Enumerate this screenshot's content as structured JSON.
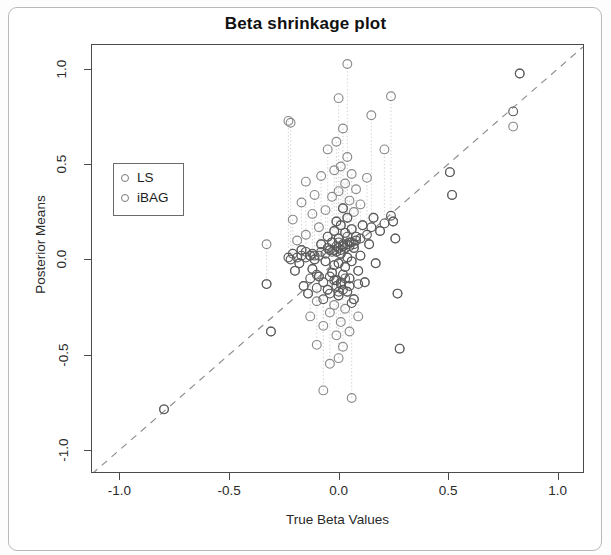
{
  "page": {
    "background": "#ffffff",
    "frame_color": "#b9b9b9"
  },
  "chart_data": {
    "type": "scatter",
    "title": "Beta shrinkage plot",
    "xlabel": "True Beta Values",
    "ylabel": "Posterior Means",
    "xlim": [
      -1.13,
      1.12
    ],
    "ylim": [
      -1.12,
      1.13
    ],
    "xticks": [
      -1.0,
      -0.5,
      0.0,
      0.5,
      1.0
    ],
    "xticklabels": [
      "-1.0",
      "-0.5",
      "0.0",
      "0.5",
      "1.0"
    ],
    "yticks": [
      -1.0,
      -0.5,
      0.0,
      0.5,
      1.0
    ],
    "yticklabels": [
      "-1.0",
      "-0.5",
      "0.0",
      "0.5",
      "1.0"
    ],
    "grid": false,
    "legend_position": "upper-left",
    "legend": [
      {
        "name": "LS",
        "marker": "open-circle",
        "color": "#7a7a7a"
      },
      {
        "name": "iBAG",
        "marker": "open-circle",
        "color": "#5a5a5a"
      }
    ],
    "reference_line": {
      "label": "y = x identity line",
      "style": "dashed",
      "color": "#8d8d8d",
      "slope": 1,
      "intercept": 0,
      "x_from": -1.13,
      "x_to": 1.12
    },
    "connector_lines": {
      "label": "vertical dotted segments joining LS and iBAG estimates",
      "style": "dotted",
      "color": "#d6d6d6"
    },
    "series": [
      {
        "name": "LS",
        "marker": "open-circle",
        "color": "#8a8a8a",
        "points": [
          [
            -0.8,
            -0.79
          ],
          [
            -0.33,
            0.08
          ],
          [
            -0.33,
            -0.13
          ],
          [
            -0.31,
            -0.38
          ],
          [
            -0.23,
            0.73
          ],
          [
            -0.22,
            0.72
          ],
          [
            -0.21,
            0.21
          ],
          [
            -0.2,
            -0.06
          ],
          [
            -0.19,
            0.1
          ],
          [
            -0.18,
            -0.02
          ],
          [
            -0.17,
            0.3
          ],
          [
            -0.17,
            0.05
          ],
          [
            -0.16,
            -0.14
          ],
          [
            -0.15,
            0.41
          ],
          [
            -0.15,
            0.13
          ],
          [
            -0.14,
            -0.18
          ],
          [
            -0.13,
            0.02
          ],
          [
            -0.13,
            -0.3
          ],
          [
            -0.12,
            0.24
          ],
          [
            -0.12,
            -0.05
          ],
          [
            -0.11,
            0.34
          ],
          [
            -0.11,
            0.0
          ],
          [
            -0.1,
            -0.22
          ],
          [
            -0.1,
            -0.45
          ],
          [
            -0.09,
            0.17
          ],
          [
            -0.09,
            -0.09
          ],
          [
            -0.08,
            0.44
          ],
          [
            -0.08,
            0.08
          ],
          [
            -0.07,
            -0.35
          ],
          [
            -0.07,
            -0.69
          ],
          [
            -0.06,
            0.26
          ],
          [
            -0.06,
            -0.01
          ],
          [
            -0.05,
            0.58
          ],
          [
            -0.05,
            0.12
          ],
          [
            -0.05,
            -0.16
          ],
          [
            -0.04,
            0.05
          ],
          [
            -0.04,
            -0.28
          ],
          [
            -0.04,
            -0.55
          ],
          [
            -0.03,
            0.33
          ],
          [
            -0.03,
            0.09
          ],
          [
            -0.03,
            -0.07
          ],
          [
            -0.02,
            0.47
          ],
          [
            -0.02,
            0.15
          ],
          [
            -0.02,
            -0.03
          ],
          [
            -0.02,
            -0.24
          ],
          [
            -0.01,
            0.62
          ],
          [
            -0.01,
            0.2
          ],
          [
            -0.01,
            0.04
          ],
          [
            -0.01,
            -0.11
          ],
          [
            -0.01,
            -0.4
          ],
          [
            0.0,
            0.85
          ],
          [
            0.0,
            0.36
          ],
          [
            0.0,
            0.11
          ],
          [
            0.0,
            -0.02
          ],
          [
            0.0,
            -0.19
          ],
          [
            0.0,
            -0.52
          ],
          [
            0.01,
            0.49
          ],
          [
            0.01,
            0.18
          ],
          [
            0.01,
            0.03
          ],
          [
            0.01,
            -0.13
          ],
          [
            0.01,
            -0.33
          ],
          [
            0.02,
            0.69
          ],
          [
            0.02,
            0.27
          ],
          [
            0.02,
            0.07
          ],
          [
            0.02,
            -0.08
          ],
          [
            0.02,
            -0.46
          ],
          [
            0.03,
            0.4
          ],
          [
            0.03,
            0.14
          ],
          [
            0.03,
            -0.04
          ],
          [
            0.03,
            -0.26
          ],
          [
            0.04,
            1.03
          ],
          [
            0.04,
            0.54
          ],
          [
            0.04,
            0.22
          ],
          [
            0.04,
            0.01
          ],
          [
            0.04,
            -0.17
          ],
          [
            0.05,
            0.31
          ],
          [
            0.05,
            0.09
          ],
          [
            0.05,
            -0.1
          ],
          [
            0.05,
            -0.38
          ],
          [
            0.06,
            0.45
          ],
          [
            0.06,
            0.16
          ],
          [
            0.06,
            -0.01
          ],
          [
            0.06,
            -0.73
          ],
          [
            0.07,
            0.25
          ],
          [
            0.07,
            0.06
          ],
          [
            0.07,
            -0.21
          ],
          [
            0.08,
            0.37
          ],
          [
            0.08,
            0.12
          ],
          [
            0.09,
            -0.06
          ],
          [
            0.09,
            -0.3
          ],
          [
            0.1,
            0.29
          ],
          [
            0.1,
            0.02
          ],
          [
            0.11,
            0.18
          ],
          [
            0.12,
            -0.12
          ],
          [
            0.13,
            0.43
          ],
          [
            0.14,
            0.08
          ],
          [
            0.15,
            0.76
          ],
          [
            0.16,
            0.22
          ],
          [
            0.17,
            -0.02
          ],
          [
            0.19,
            0.15
          ],
          [
            0.21,
            0.58
          ],
          [
            0.24,
            0.86
          ],
          [
            0.25,
            0.2
          ],
          [
            0.26,
            0.11
          ],
          [
            0.27,
            -0.18
          ],
          [
            0.28,
            -0.47
          ],
          [
            0.51,
            0.46
          ],
          [
            0.52,
            0.34
          ],
          [
            0.8,
            0.7
          ],
          [
            0.83,
            0.98
          ]
        ]
      },
      {
        "name": "iBAG",
        "marker": "open-circle",
        "color": "#5a5a5a",
        "points": [
          [
            -0.8,
            -0.79
          ],
          [
            -0.33,
            -0.13
          ],
          [
            -0.31,
            -0.38
          ],
          [
            -0.23,
            0.01
          ],
          [
            -0.22,
            0.0
          ],
          [
            -0.21,
            0.03
          ],
          [
            -0.2,
            -0.06
          ],
          [
            -0.19,
            0.01
          ],
          [
            -0.18,
            -0.02
          ],
          [
            -0.17,
            0.02
          ],
          [
            -0.17,
            0.05
          ],
          [
            -0.16,
            -0.14
          ],
          [
            -0.15,
            0.04
          ],
          [
            -0.15,
            0.01
          ],
          [
            -0.14,
            -0.18
          ],
          [
            -0.13,
            0.02
          ],
          [
            -0.13,
            -0.1
          ],
          [
            -0.12,
            0.03
          ],
          [
            -0.12,
            -0.05
          ],
          [
            -0.11,
            0.02
          ],
          [
            -0.11,
            0.0
          ],
          [
            -0.1,
            -0.08
          ],
          [
            -0.1,
            -0.15
          ],
          [
            -0.09,
            0.02
          ],
          [
            -0.09,
            -0.09
          ],
          [
            -0.08,
            0.04
          ],
          [
            -0.08,
            0.08
          ],
          [
            -0.07,
            -0.12
          ],
          [
            -0.07,
            -0.21
          ],
          [
            -0.06,
            0.03
          ],
          [
            -0.06,
            -0.01
          ],
          [
            -0.05,
            0.06
          ],
          [
            -0.05,
            0.12
          ],
          [
            -0.05,
            -0.16
          ],
          [
            -0.04,
            0.05
          ],
          [
            -0.04,
            -0.09
          ],
          [
            -0.04,
            -0.18
          ],
          [
            -0.03,
            0.04
          ],
          [
            -0.03,
            0.09
          ],
          [
            -0.03,
            -0.07
          ],
          [
            -0.02,
            0.05
          ],
          [
            -0.02,
            0.15
          ],
          [
            -0.02,
            -0.03
          ],
          [
            -0.02,
            -0.11
          ],
          [
            -0.01,
            0.07
          ],
          [
            -0.01,
            0.2
          ],
          [
            -0.01,
            0.04
          ],
          [
            -0.01,
            -0.11
          ],
          [
            -0.01,
            -0.14
          ],
          [
            0.0,
            0.09
          ],
          [
            0.0,
            0.06
          ],
          [
            0.0,
            0.11
          ],
          [
            0.0,
            -0.02
          ],
          [
            0.0,
            -0.19
          ],
          [
            0.0,
            -0.17
          ],
          [
            0.01,
            0.05
          ],
          [
            0.01,
            0.18
          ],
          [
            0.01,
            0.03
          ],
          [
            0.01,
            -0.13
          ],
          [
            0.01,
            -0.12
          ],
          [
            0.02,
            0.08
          ],
          [
            0.02,
            0.27
          ],
          [
            0.02,
            0.07
          ],
          [
            0.02,
            -0.08
          ],
          [
            0.02,
            -0.16
          ],
          [
            0.03,
            0.06
          ],
          [
            0.03,
            0.14
          ],
          [
            0.03,
            -0.04
          ],
          [
            0.03,
            -0.1
          ],
          [
            0.04,
            0.12
          ],
          [
            0.04,
            0.08
          ],
          [
            0.04,
            0.22
          ],
          [
            0.04,
            0.01
          ],
          [
            0.04,
            -0.17
          ],
          [
            0.05,
            0.07
          ],
          [
            0.05,
            0.09
          ],
          [
            0.05,
            -0.1
          ],
          [
            0.05,
            -0.14
          ],
          [
            0.06,
            0.09
          ],
          [
            0.06,
            0.16
          ],
          [
            0.06,
            -0.01
          ],
          [
            0.06,
            -0.23
          ],
          [
            0.07,
            0.08
          ],
          [
            0.07,
            0.06
          ],
          [
            0.07,
            -0.21
          ],
          [
            0.08,
            0.1
          ],
          [
            0.08,
            0.12
          ],
          [
            0.09,
            -0.06
          ],
          [
            0.09,
            -0.13
          ],
          [
            0.1,
            0.11
          ],
          [
            0.1,
            0.02
          ],
          [
            0.11,
            0.18
          ],
          [
            0.12,
            -0.12
          ],
          [
            0.13,
            0.13
          ],
          [
            0.14,
            0.08
          ],
          [
            0.15,
            0.17
          ],
          [
            0.16,
            0.22
          ],
          [
            0.17,
            -0.02
          ],
          [
            0.19,
            0.15
          ],
          [
            0.21,
            0.19
          ],
          [
            0.24,
            0.23
          ],
          [
            0.25,
            0.2
          ],
          [
            0.26,
            0.11
          ],
          [
            0.27,
            -0.18
          ],
          [
            0.28,
            -0.47
          ],
          [
            0.51,
            0.46
          ],
          [
            0.52,
            0.34
          ],
          [
            0.8,
            0.78
          ],
          [
            0.83,
            0.98
          ]
        ]
      }
    ],
    "pairs": [
      [
        -0.33,
        0.08,
        -0.13
      ],
      [
        -0.23,
        0.73,
        0.01
      ],
      [
        -0.22,
        0.72,
        0.0
      ],
      [
        -0.21,
        0.21,
        0.03
      ],
      [
        -0.19,
        0.1,
        0.01
      ],
      [
        -0.17,
        0.3,
        0.02
      ],
      [
        -0.15,
        0.41,
        0.04
      ],
      [
        -0.13,
        -0.3,
        -0.1
      ],
      [
        -0.12,
        0.24,
        0.03
      ],
      [
        -0.11,
        0.34,
        0.02
      ],
      [
        -0.1,
        -0.22,
        -0.08
      ],
      [
        -0.1,
        -0.45,
        -0.15
      ],
      [
        -0.09,
        0.17,
        0.02
      ],
      [
        -0.08,
        0.44,
        0.04
      ],
      [
        -0.07,
        -0.35,
        -0.12
      ],
      [
        -0.07,
        -0.69,
        -0.21
      ],
      [
        -0.06,
        0.26,
        0.03
      ],
      [
        -0.05,
        0.58,
        0.06
      ],
      [
        -0.04,
        -0.28,
        -0.09
      ],
      [
        -0.04,
        -0.55,
        -0.18
      ],
      [
        -0.03,
        0.33,
        0.04
      ],
      [
        -0.02,
        0.47,
        0.05
      ],
      [
        -0.02,
        -0.24,
        -0.11
      ],
      [
        -0.01,
        0.62,
        0.07
      ],
      [
        -0.01,
        -0.4,
        -0.14
      ],
      [
        0.0,
        0.85,
        0.09
      ],
      [
        0.0,
        0.36,
        0.06
      ],
      [
        0.0,
        -0.52,
        -0.17
      ],
      [
        0.01,
        0.49,
        0.05
      ],
      [
        0.01,
        -0.33,
        -0.12
      ],
      [
        0.02,
        0.69,
        0.08
      ],
      [
        0.02,
        -0.46,
        -0.16
      ],
      [
        0.03,
        0.4,
        0.06
      ],
      [
        0.03,
        -0.26,
        -0.1
      ],
      [
        0.04,
        1.03,
        0.12
      ],
      [
        0.04,
        0.54,
        0.08
      ],
      [
        0.05,
        0.31,
        0.07
      ],
      [
        0.05,
        -0.38,
        -0.14
      ],
      [
        0.06,
        0.45,
        0.09
      ],
      [
        0.06,
        -0.73,
        -0.23
      ],
      [
        0.07,
        0.25,
        0.08
      ],
      [
        0.08,
        0.37,
        0.1
      ],
      [
        0.09,
        -0.3,
        -0.13
      ],
      [
        0.1,
        0.29,
        0.11
      ],
      [
        0.13,
        0.43,
        0.13
      ],
      [
        0.15,
        0.76,
        0.17
      ],
      [
        0.21,
        0.58,
        0.19
      ],
      [
        0.24,
        0.86,
        0.23
      ],
      [
        0.8,
        0.7,
        0.78
      ]
    ]
  }
}
